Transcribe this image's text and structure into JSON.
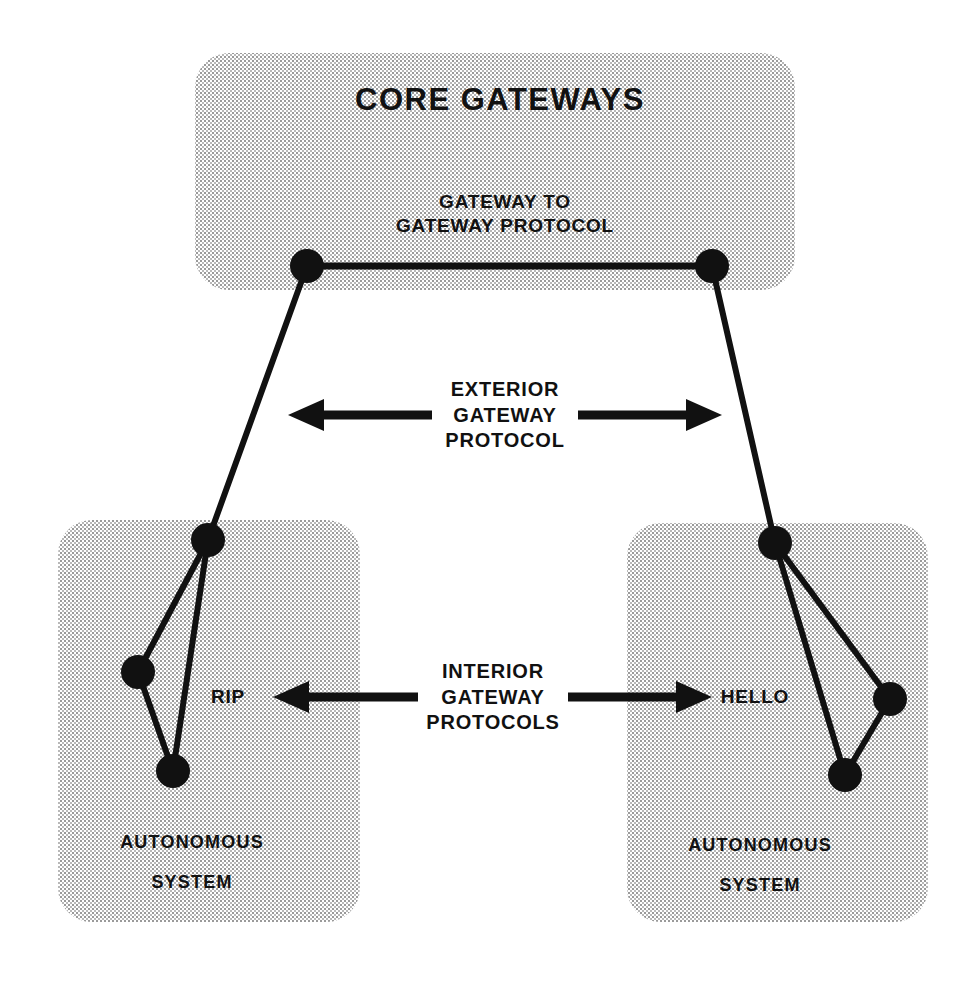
{
  "diagram": {
    "title_semantic": "internet-gateway-protocol-architecture",
    "background_color": "#ffffff",
    "ink_color": "#111111",
    "box_fill_color": "#c8c8c8",
    "groups": [
      {
        "id": "core-gateways",
        "title": "CORE GATEWAYS",
        "protocol_label_line1": "GATEWAY TO",
        "protocol_label_line2": "GATEWAY PROTOCOL",
        "x": 195,
        "y": 53,
        "width": 600,
        "height": 237,
        "radius": 34
      },
      {
        "id": "autonomous-system-left",
        "label_line1": "AUTONOMOUS",
        "label_line2": "SYSTEM",
        "protocol": "RIP",
        "x": 58,
        "y": 520,
        "width": 302,
        "height": 402,
        "radius": 34
      },
      {
        "id": "autonomous-system-right",
        "label_line1": "AUTONOMOUS",
        "label_line2": "SYSTEM",
        "protocol": "HELLO",
        "x": 627,
        "y": 523,
        "width": 301,
        "height": 399,
        "radius": 34
      }
    ],
    "nodes": [
      {
        "id": "core-gw-left",
        "cx": 307,
        "cy": 266,
        "r": 17
      },
      {
        "id": "core-gw-right",
        "cx": 712,
        "cy": 266,
        "r": 17
      },
      {
        "id": "as-left-gateway",
        "cx": 208,
        "cy": 540,
        "r": 17
      },
      {
        "id": "as-left-west",
        "cx": 138,
        "cy": 672,
        "r": 17
      },
      {
        "id": "as-left-south",
        "cx": 173,
        "cy": 771,
        "r": 17
      },
      {
        "id": "as-right-gateway",
        "cx": 775,
        "cy": 543,
        "r": 17
      },
      {
        "id": "as-right-east",
        "cx": 890,
        "cy": 699,
        "r": 17
      },
      {
        "id": "as-right-south",
        "cx": 845,
        "cy": 775,
        "r": 17
      }
    ],
    "links": [
      {
        "id": "core-backbone",
        "from": "core-gw-left",
        "to": "core-gw-right",
        "width": 7
      },
      {
        "id": "egp-left-link",
        "from": "core-gw-left",
        "to": "as-left-gateway",
        "width": 6
      },
      {
        "id": "egp-right-link",
        "from": "core-gw-right",
        "to": "as-right-gateway",
        "width": 6
      },
      {
        "id": "as-left-link-a",
        "from": "as-left-gateway",
        "to": "as-left-west",
        "width": 6
      },
      {
        "id": "as-left-link-b",
        "from": "as-left-gateway",
        "to": "as-left-south",
        "width": 6
      },
      {
        "id": "as-left-link-c",
        "from": "as-left-west",
        "to": "as-left-south",
        "width": 6
      },
      {
        "id": "as-right-link-a",
        "from": "as-right-gateway",
        "to": "as-right-east",
        "width": 6
      },
      {
        "id": "as-right-link-b",
        "from": "as-right-gateway",
        "to": "as-right-south",
        "width": 6
      },
      {
        "id": "as-right-link-c",
        "from": "as-right-east",
        "to": "as-right-south",
        "width": 6
      }
    ],
    "annotations": [
      {
        "id": "exterior-gateway-protocol",
        "line1": "EXTERIOR",
        "line2": "GATEWAY",
        "line3": "PROTOCOL",
        "cx": 505,
        "cy": 415,
        "arrow_left": {
          "tip_x": 288,
          "tail_x": 432,
          "y": 415
        },
        "arrow_right": {
          "tail_x": 578,
          "tip_x": 722,
          "y": 415
        }
      },
      {
        "id": "interior-gateway-protocols",
        "line1": "INTERIOR",
        "line2": "GATEWAY",
        "line3": "PROTOCOLS",
        "cx": 493,
        "cy": 697,
        "arrow_left": {
          "tip_x": 273,
          "tail_x": 418,
          "y": 697
        },
        "arrow_right": {
          "tail_x": 568,
          "tip_x": 712,
          "y": 697
        }
      }
    ],
    "protocol_tags": [
      {
        "id": "rip-label",
        "text": "RIP",
        "cx": 228,
        "cy": 697
      },
      {
        "id": "hello-label",
        "text": "HELLO",
        "cx": 755,
        "cy": 697
      }
    ]
  }
}
